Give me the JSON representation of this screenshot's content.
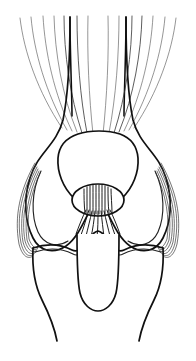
{
  "figure": {
    "view": "anterior",
    "style": "line drawing",
    "background_color": "#ffffff",
    "line_color": "#111111",
    "fiber_color": "#555555",
    "canvas": {
      "width": 196,
      "height": 361
    }
  },
  "structures": {
    "quadriceps_tendon": {
      "name": "quadriceps tendon fibers",
      "fiber_count_left": 8,
      "fiber_count_right": 8,
      "description": "fanned striated fibers converging on the superior patellar border"
    },
    "femur_shaft": {
      "name": "femoral shaft",
      "description": "paired dark vertical borders widening into the condyles"
    },
    "patella": {
      "name": "patella",
      "description": "rounded triangular outline with broad superior base and inferior apex"
    },
    "medial_condyle": {
      "name": "medial femoral condyle"
    },
    "lateral_condyle": {
      "name": "lateral femoral condyle"
    },
    "intercondylar_fibers": {
      "name": "intercondylar notch fibers",
      "description": "dense short striations beneath the patellar apex"
    },
    "collateral_ligament_left": {
      "name": "lateral collateral ligament bundle",
      "fiber_count": 6
    },
    "collateral_ligament_right": {
      "name": "medial collateral ligament bundle",
      "fiber_count": 6
    },
    "tibial_plateau": {
      "name": "tibial plateau"
    },
    "tibial_tuberosity": {
      "name": "tibial tuberosity / patellar tendon outline",
      "description": "central U-shaped contour descending from the joint line"
    },
    "tibial_shaft": {
      "name": "tibial shaft"
    }
  },
  "caption": {
    "text": "",
    "visible": false
  }
}
